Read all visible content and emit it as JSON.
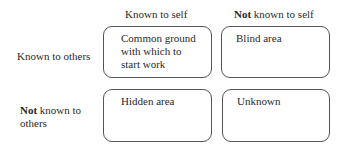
{
  "diagram": {
    "columns": [
      {
        "label": "Known to self",
        "bold_prefix": ""
      },
      {
        "label": " known to self",
        "bold_prefix": "Not"
      }
    ],
    "rows": [
      {
        "label": "Known to others",
        "bold_prefix": ""
      },
      {
        "label_line1": " known to",
        "label_line2": "others",
        "bold_prefix": "Not"
      }
    ],
    "cells": [
      {
        "line1": "Common ground",
        "line2": "with which to",
        "line3": "start work"
      },
      {
        "line1": "Blind area"
      },
      {
        "line1": "Hidden area"
      },
      {
        "line1": "Unknown"
      }
    ],
    "border_color": "#555555"
  }
}
